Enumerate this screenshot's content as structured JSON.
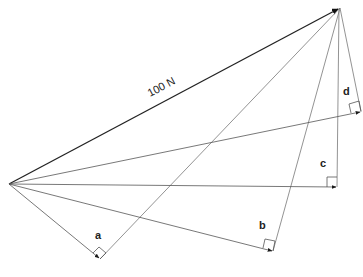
{
  "diagram": {
    "type": "vector-resolution",
    "resultant": {
      "label": "100 N",
      "from": [
        9,
        184
      ],
      "to": [
        340,
        8
      ],
      "color": "#1a1a1a"
    },
    "components": [
      {
        "label": "a",
        "foot": [
          100,
          259
        ],
        "label_pos": [
          98,
          238
        ]
      },
      {
        "label": "b",
        "foot": [
          273,
          251
        ],
        "label_pos": [
          262,
          228
        ]
      },
      {
        "label": "c",
        "foot": [
          337,
          187
        ],
        "label_pos": [
          323,
          166
        ]
      },
      {
        "label": "d",
        "foot": [
          361,
          112
        ],
        "label_pos": [
          345,
          95
        ]
      }
    ],
    "line_color": "#555555"
  }
}
